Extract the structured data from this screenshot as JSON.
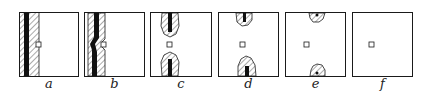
{
  "figure": {
    "colors": {
      "ink": "#1a1a1a",
      "hatch": "#555555",
      "background": "#ffffff"
    },
    "panels": [
      {
        "label": "a",
        "x": 19,
        "variant": "full-stripe"
      },
      {
        "label": "b",
        "x": 84,
        "variant": "bent-stripe"
      },
      {
        "label": "c",
        "x": 150,
        "variant": "two-lobes-large"
      },
      {
        "label": "d",
        "x": 218,
        "variant": "two-lobes-offset"
      },
      {
        "label": "e",
        "x": 285,
        "variant": "two-lobes-small"
      },
      {
        "label": "f",
        "x": 352,
        "variant": "empty"
      }
    ]
  }
}
